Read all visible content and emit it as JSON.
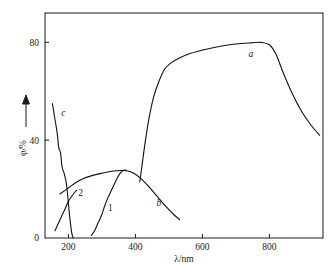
{
  "chart_data": {
    "type": "line",
    "title": "",
    "xlabel": "λ/nm",
    "ylabel": "φ/%",
    "xlim": [
      130,
      960
    ],
    "ylim": [
      0,
      92
    ],
    "xticks": [
      200,
      400,
      600,
      800
    ],
    "xticklabels": [
      "200",
      "400",
      "600",
      "800"
    ],
    "yticks": [
      0,
      40,
      80
    ],
    "yticklabels": [
      "0",
      "40",
      "80"
    ],
    "grid": false,
    "legend": "inline-curve-labels",
    "series": [
      {
        "name": "a",
        "label": "a",
        "label_x": 745,
        "label_y": 74,
        "points": [
          [
            413,
            23
          ],
          [
            420,
            30
          ],
          [
            430,
            40
          ],
          [
            442,
            50
          ],
          [
            455,
            58
          ],
          [
            470,
            64
          ],
          [
            487,
            69
          ],
          [
            505,
            71.5
          ],
          [
            530,
            73.5
          ],
          [
            565,
            75.5
          ],
          [
            605,
            77
          ],
          [
            650,
            78.3
          ],
          [
            700,
            79.3
          ],
          [
            745,
            79.8
          ],
          [
            775,
            80
          ],
          [
            800,
            79
          ],
          [
            820,
            75
          ],
          [
            840,
            68
          ],
          [
            865,
            60
          ],
          [
            895,
            52
          ],
          [
            925,
            46
          ],
          [
            950,
            42
          ]
        ]
      },
      {
        "name": "b",
        "label": "b",
        "label_x": 470,
        "label_y": 13,
        "points": [
          [
            175,
            18
          ],
          [
            195,
            20
          ],
          [
            215,
            22
          ],
          [
            240,
            24
          ],
          [
            270,
            25.5
          ],
          [
            300,
            26.5
          ],
          [
            330,
            27.3
          ],
          [
            355,
            27.6
          ],
          [
            375,
            27.5
          ],
          [
            395,
            26.5
          ],
          [
            415,
            24.5
          ],
          [
            440,
            21
          ],
          [
            465,
            17
          ],
          [
            490,
            13
          ],
          [
            515,
            9.5
          ],
          [
            532,
            7.5
          ]
        ]
      },
      {
        "name": "c",
        "label": "c",
        "label_x": 185,
        "label_y": 50,
        "points": [
          [
            152,
            55
          ],
          [
            158,
            50
          ],
          [
            164,
            45
          ],
          [
            168,
            41
          ],
          [
            170,
            38
          ],
          [
            172,
            36.5
          ],
          [
            176,
            35
          ],
          [
            178,
            33
          ],
          [
            180,
            30
          ],
          [
            183,
            28
          ],
          [
            188,
            26
          ],
          [
            194,
            22
          ],
          [
            198,
            17
          ],
          [
            202,
            11
          ],
          [
            206,
            6
          ],
          [
            210,
            2
          ],
          [
            214,
            0
          ]
        ]
      },
      {
        "name": "1",
        "label": "1",
        "label_x": 325,
        "label_y": 11,
        "points": [
          [
            268,
            1
          ],
          [
            278,
            3
          ],
          [
            288,
            6
          ],
          [
            298,
            9
          ],
          [
            308,
            13
          ],
          [
            318,
            16.5
          ],
          [
            330,
            20
          ],
          [
            342,
            23.5
          ],
          [
            352,
            26
          ],
          [
            362,
            27.5
          ],
          [
            372,
            27.8
          ]
        ]
      },
      {
        "name": "2",
        "label": "2",
        "label_x": 236,
        "label_y": 17,
        "points": [
          [
            160,
            3
          ],
          [
            170,
            6
          ],
          [
            180,
            9
          ],
          [
            190,
            12
          ],
          [
            200,
            15
          ],
          [
            212,
            17.5
          ],
          [
            224,
            19.5
          ]
        ]
      }
    ]
  },
  "axis": {
    "y_arrow": "up-arrow"
  }
}
